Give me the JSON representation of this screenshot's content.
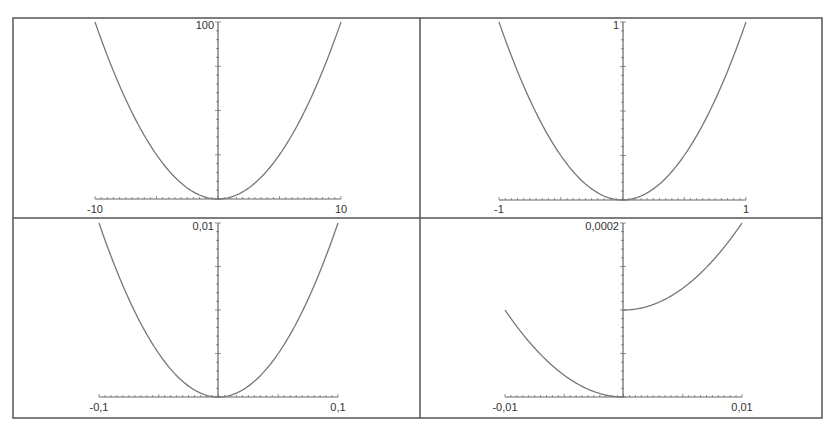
{
  "chart_data": [
    {
      "type": "line",
      "title": "",
      "function": "x^2",
      "xlabel": "",
      "ylabel": "",
      "xlim": [
        -10,
        10
      ],
      "ylim": [
        0,
        100
      ],
      "x_tick_labels": [
        "-10",
        "10"
      ],
      "y_tick_labels": [
        "100"
      ],
      "grid": false,
      "legend": null,
      "series": [
        {
          "name": "y = x^2",
          "x": [
            -10,
            -8,
            -6,
            -4,
            -2,
            0,
            2,
            4,
            6,
            8,
            10
          ],
          "y": [
            100,
            64,
            36,
            16,
            4,
            0,
            4,
            16,
            36,
            64,
            100
          ]
        }
      ]
    },
    {
      "type": "line",
      "title": "",
      "function": "x^2",
      "xlabel": "",
      "ylabel": "",
      "xlim": [
        -1,
        1
      ],
      "ylim": [
        0,
        1
      ],
      "x_tick_labels": [
        "-1",
        "1"
      ],
      "y_tick_labels": [
        "1"
      ],
      "grid": false,
      "legend": null,
      "series": [
        {
          "name": "y = x^2",
          "x": [
            -1,
            -0.8,
            -0.6,
            -0.4,
            -0.2,
            0,
            0.2,
            0.4,
            0.6,
            0.8,
            1
          ],
          "y": [
            1,
            0.64,
            0.36,
            0.16,
            0.04,
            0,
            0.04,
            0.16,
            0.36,
            0.64,
            1
          ]
        }
      ]
    },
    {
      "type": "line",
      "title": "",
      "function": "x^2",
      "xlabel": "",
      "ylabel": "",
      "xlim": [
        -0.1,
        0.1
      ],
      "ylim": [
        0,
        0.01
      ],
      "x_tick_labels": [
        "-0,1",
        "0,1"
      ],
      "y_tick_labels": [
        "0,01"
      ],
      "grid": false,
      "legend": null,
      "series": [
        {
          "name": "y = x^2",
          "x": [
            -0.1,
            -0.08,
            -0.06,
            -0.04,
            -0.02,
            0,
            0.02,
            0.04,
            0.06,
            0.08,
            0.1
          ],
          "y": [
            0.01,
            0.0064,
            0.0036,
            0.0016,
            0.0004,
            0,
            0.0004,
            0.0016,
            0.0036,
            0.0064,
            0.01
          ]
        }
      ]
    },
    {
      "type": "line",
      "title": "",
      "function": "x^2 for x<0; x^2 + 0.0001 for x>=0",
      "xlabel": "",
      "ylabel": "",
      "xlim": [
        -0.01,
        0.01
      ],
      "ylim": [
        0,
        0.0002
      ],
      "x_tick_labels": [
        "-0,01",
        "0,01"
      ],
      "y_tick_labels": [
        "0,0002"
      ],
      "grid": false,
      "legend": null,
      "series": [
        {
          "name": "left branch",
          "x": [
            -0.01,
            -0.008,
            -0.006,
            -0.004,
            -0.002,
            0
          ],
          "y": [
            0.0001,
            6.4e-05,
            3.6e-05,
            1.6e-05,
            4e-06,
            0
          ]
        },
        {
          "name": "right branch",
          "x": [
            0,
            0.002,
            0.004,
            0.006,
            0.008,
            0.01
          ],
          "y": [
            0.0001,
            0.000104,
            0.000116,
            0.000136,
            0.000164,
            0.0002
          ]
        }
      ]
    }
  ],
  "panels": [
    {
      "x_min_label": "-10",
      "x_max_label": "10",
      "y_max_label": "100"
    },
    {
      "x_min_label": "-1",
      "x_max_label": "1",
      "y_max_label": "1"
    },
    {
      "x_min_label": "-0,1",
      "x_max_label": "0,1",
      "y_max_label": "0,01"
    },
    {
      "x_min_label": "-0,01",
      "x_max_label": "0,01",
      "y_max_label": "0,0002"
    }
  ],
  "colors": {
    "frame": "#555555",
    "axis": "#666666",
    "curve": "#777777",
    "text": "#333333"
  }
}
